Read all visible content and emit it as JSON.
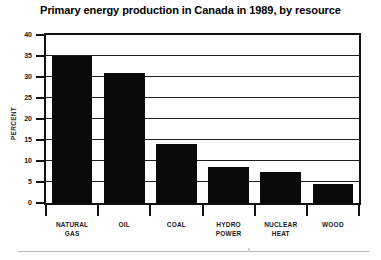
{
  "chart_data": {
    "type": "bar",
    "title": "Primary energy production in Canada in 1989, by resource",
    "xlabel": "",
    "ylabel": "PERCENT",
    "categories": [
      "NATURAL GAS",
      "OIL",
      "COAL",
      "HYDRO POWER",
      "NUCLEAR HEAT",
      "WOOD"
    ],
    "category_lines": [
      [
        "NATURAL",
        "GAS"
      ],
      [
        "OIL",
        ""
      ],
      [
        "COAL",
        ""
      ],
      [
        "HYDRO",
        "POWER"
      ],
      [
        "NUCLEAR",
        "HEAT"
      ],
      [
        "WOOD",
        ""
      ]
    ],
    "values": [
      35,
      31,
      14,
      8.5,
      7.5,
      4.5
    ],
    "ylim": [
      0,
      40
    ],
    "ytick_values": [
      0,
      5,
      10,
      15,
      20,
      25,
      30,
      35,
      40
    ],
    "ytick_labels": [
      "0",
      "5",
      "10",
      "15",
      "20",
      "25",
      "30",
      "35",
      "40"
    ],
    "grid": true,
    "grid_axis": "y",
    "legend": false,
    "bar_color": "#090909",
    "frame_color": "#111111",
    "background": "#ffffff"
  }
}
